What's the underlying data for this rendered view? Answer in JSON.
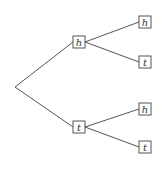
{
  "diagram": {
    "type": "probability-tree",
    "colors": {
      "line": "#555555",
      "text": "#333333",
      "background": "#ffffff"
    },
    "root": {
      "x": 15,
      "y": 87
    },
    "nodes": [
      {
        "id": "n1",
        "label": "h",
        "x": 79,
        "y": 42,
        "parent": "root"
      },
      {
        "id": "n2",
        "label": "t",
        "x": 79,
        "y": 127,
        "parent": "root"
      },
      {
        "id": "n11",
        "label": "h",
        "x": 145,
        "y": 22,
        "parent": "n1"
      },
      {
        "id": "n12",
        "label": "t",
        "x": 145,
        "y": 62,
        "parent": "n1"
      },
      {
        "id": "n21",
        "label": "h",
        "x": 145,
        "y": 109,
        "parent": "n2"
      },
      {
        "id": "n22",
        "label": "t",
        "x": 145,
        "y": 147,
        "parent": "n2"
      }
    ],
    "box_size": 12
  }
}
